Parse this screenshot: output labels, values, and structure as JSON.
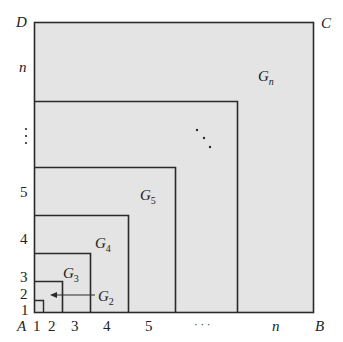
{
  "colors": {
    "fill": "#e4e4e4",
    "stroke": "#2a2a2a",
    "text": "#222222"
  },
  "corners": {
    "A": "A",
    "B": "B",
    "C": "C",
    "D": "D"
  },
  "regions": [
    {
      "name": "G",
      "sub": "n"
    },
    {
      "name": "G",
      "sub": "5"
    },
    {
      "name": "G",
      "sub": "4"
    },
    {
      "name": "G",
      "sub": "3"
    },
    {
      "name": "G",
      "sub": "2"
    }
  ],
  "x_ticks": [
    "1",
    "2",
    "3",
    "4",
    "5",
    "· · ·",
    "n"
  ],
  "y_ticks": [
    "1",
    "2",
    "3",
    "4",
    "5",
    "⋮",
    "n"
  ],
  "diagonal_dots": "⋰"
}
